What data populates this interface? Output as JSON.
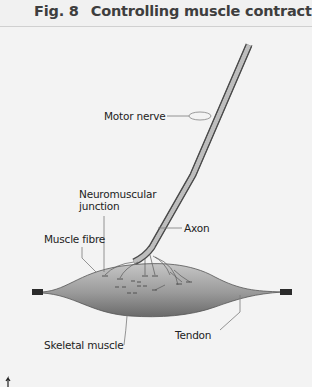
{
  "figure": {
    "number": "Fig. 8",
    "title": "Controlling muscle contraction"
  },
  "labels": {
    "motor_nerve": "Motor nerve",
    "neuromuscular_line1": "Neuromuscular",
    "neuromuscular_line2": "junction",
    "axon": "Axon",
    "muscle_fibre": "Muscle fibre",
    "skeletal_muscle": "Skeletal muscle",
    "tendon": "Tendon"
  },
  "colors": {
    "background": "#f3f3f3",
    "title_text": "#3e3e3e",
    "muscle_light": "#c4c4c4",
    "muscle_dark": "#6e6e6e",
    "tendon": "#2b2b2b",
    "nerve_outline": "#4a4a4a",
    "nerve_fill": "#b8b8b8"
  }
}
